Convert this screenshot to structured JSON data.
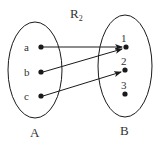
{
  "title": {
    "main": "R",
    "subscript": "2"
  },
  "sets": [
    {
      "name": "A",
      "elements": [
        "a",
        "b",
        "c"
      ]
    },
    {
      "name": "B",
      "elements": [
        "1",
        "2",
        "3"
      ]
    }
  ],
  "relation": [
    {
      "from": "a",
      "to": "1"
    },
    {
      "from": "b",
      "to": "1"
    },
    {
      "from": "c",
      "to": "2"
    }
  ],
  "colors": {
    "stroke": "#1a1a1a",
    "text": "#333333",
    "background": "#ffffff"
  }
}
